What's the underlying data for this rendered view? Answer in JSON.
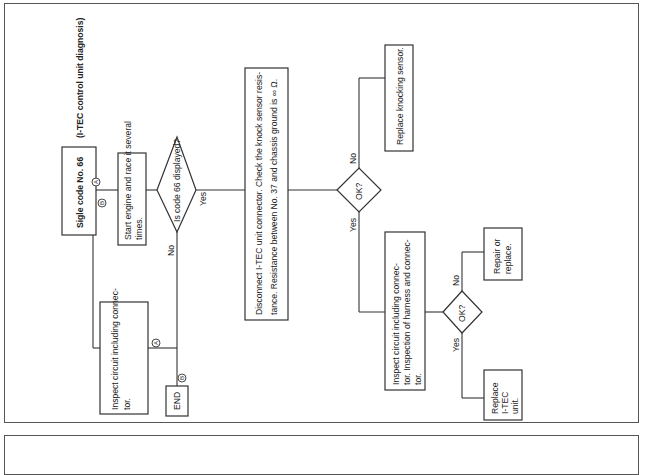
{
  "diagram": {
    "orientation": "rotated-90-ccw",
    "title": "Sigle code No. 66",
    "subtitle": "(I-TEC control unit diagnosis)",
    "connectors": {
      "a": "A",
      "b": "B"
    },
    "nodes": {
      "start_engine": {
        "line1": "Start engine and race it several",
        "line2": "times."
      },
      "decision_code66": {
        "label": "Is code 66 displayed?",
        "yes": "Yes",
        "no": "No"
      },
      "inspect_circuit_1": {
        "line1": "Inspect circuit including connec-",
        "line2": "tor."
      },
      "end": {
        "label": "END"
      },
      "disconnect": {
        "line1": "Disconnect I-TEC unit connector.  Check the knock sensor resis-",
        "line2": "tance.  Resistance between No. 37 and chassis ground is ∞ Ω."
      },
      "decision_ok_1": {
        "label": "OK?",
        "yes": "Yes",
        "no": "No"
      },
      "replace_sensor": {
        "label": "Replace knocking sensor."
      },
      "inspect_circuit_2": {
        "line1": "Inspect    circuit    including    connec-",
        "line2": "tor.  Inspection of harness and connec-",
        "line3": "tor."
      },
      "decision_ok_2": {
        "label": "OK?",
        "yes": "Yes",
        "no": "No"
      },
      "repair_replace": {
        "line1": "Repair or",
        "line2": "replace."
      },
      "replace_unit": {
        "line1": "Replace",
        "line2": "I-TEC",
        "line3": "unit."
      }
    },
    "colors": {
      "line": "#333333",
      "background": "#ffffff",
      "text": "#222222"
    }
  }
}
